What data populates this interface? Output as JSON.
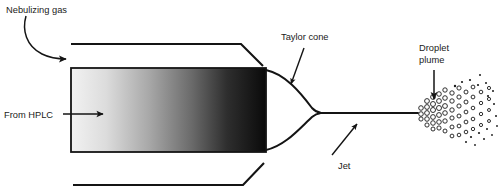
{
  "diagram": {
    "background_color": "#ffffff",
    "ink_color": "#141414",
    "labels": {
      "nebulizing_gas": "Nebulizing gas",
      "from_hplc": "From HPLC",
      "taylor_cone": "Taylor cone",
      "jet": "Jet",
      "droplet_plume_line1": "Droplet",
      "droplet_plume_line2": "plume"
    },
    "capillary": {
      "x": 71,
      "y": 68,
      "width": 195,
      "height": 84,
      "gradient_from": "#f0f0f0",
      "gradient_to": "#0a0a0a",
      "border_color": "#141414"
    },
    "nebulizer_walls": {
      "top_y": 44,
      "bottom_y": 185,
      "start_x": 71,
      "bend_x": 241,
      "end_x": 263
    },
    "jet": {
      "start_x": 320,
      "end_x": 418,
      "y": 113
    },
    "taylor_cone": {
      "apex_x": 320,
      "apex_y": 113,
      "base_x": 266,
      "base_top_y": 70,
      "base_bottom_y": 150
    },
    "plume": {
      "origin_x": 418,
      "origin_y": 113,
      "open_droplets": [
        [
          421,
          108,
          2.3
        ],
        [
          421,
          114,
          2.3
        ],
        [
          421,
          119,
          2.1
        ],
        [
          427,
          101,
          2.4
        ],
        [
          427,
          107,
          2.4
        ],
        [
          427,
          113,
          2.4
        ],
        [
          427,
          119,
          2.3
        ],
        [
          427,
          125,
          2.1
        ],
        [
          433,
          97,
          2.4
        ],
        [
          433,
          104,
          2.5
        ],
        [
          433,
          110,
          2.5
        ],
        [
          433,
          117,
          2.4
        ],
        [
          433,
          123,
          2.3
        ],
        [
          433,
          129,
          2.0
        ],
        [
          439,
          94,
          2.3
        ],
        [
          439,
          101,
          2.4
        ],
        [
          439,
          108,
          2.5
        ],
        [
          439,
          115,
          2.4
        ],
        [
          439,
          122,
          2.3
        ],
        [
          439,
          128,
          2.1
        ],
        [
          445,
          90,
          2.2
        ],
        [
          445,
          98,
          2.3
        ],
        [
          445,
          106,
          2.4
        ],
        [
          445,
          113,
          2.3
        ],
        [
          445,
          121,
          2.2
        ],
        [
          445,
          131,
          2.0
        ],
        [
          452,
          93,
          2.2
        ],
        [
          452,
          101,
          2.2
        ],
        [
          452,
          110,
          2.2
        ],
        [
          452,
          118,
          2.1
        ],
        [
          452,
          127,
          2.0
        ],
        [
          452,
          136,
          1.9
        ],
        [
          459,
          88,
          2.1
        ],
        [
          459,
          97,
          2.1
        ],
        [
          459,
          106,
          2.1
        ],
        [
          459,
          116,
          2.0
        ],
        [
          459,
          126,
          1.9
        ],
        [
          459,
          135,
          1.8
        ],
        [
          466,
          92,
          2.0
        ],
        [
          466,
          102,
          2.0
        ],
        [
          466,
          112,
          1.9
        ],
        [
          466,
          122,
          1.9
        ],
        [
          466,
          132,
          1.8
        ],
        [
          473,
          87,
          1.9
        ],
        [
          473,
          97,
          1.9
        ],
        [
          473,
          108,
          1.8
        ],
        [
          473,
          119,
          1.8
        ],
        [
          473,
          129,
          1.7
        ],
        [
          481,
          92,
          1.8
        ],
        [
          481,
          103,
          1.7
        ],
        [
          481,
          114,
          1.7
        ],
        [
          481,
          125,
          1.6
        ],
        [
          489,
          88,
          1.6
        ],
        [
          489,
          99,
          1.6
        ],
        [
          489,
          110,
          1.5
        ],
        [
          489,
          121,
          1.5
        ]
      ],
      "solid_droplets": [
        [
          455,
          86,
          1.2
        ],
        [
          462,
          82,
          1.1
        ],
        [
          470,
          80,
          1.1
        ],
        [
          478,
          85,
          1.1
        ],
        [
          486,
          83,
          1.0
        ],
        [
          493,
          91,
          1.0
        ],
        [
          471,
          137,
          1.1
        ],
        [
          479,
          133,
          1.1
        ],
        [
          487,
          129,
          1.0
        ],
        [
          494,
          104,
          1.0
        ],
        [
          496,
          116,
          1.0
        ],
        [
          484,
          139,
          1.0
        ],
        [
          492,
          135,
          0.9
        ],
        [
          497,
          126,
          0.9
        ],
        [
          466,
          142,
          1.0
        ],
        [
          475,
          145,
          0.9
        ],
        [
          488,
          96,
          1.1
        ],
        [
          480,
          75,
          1.0
        ]
      ]
    }
  }
}
